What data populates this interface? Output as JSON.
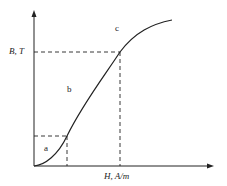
{
  "diagram": {
    "type": "B-H magnetization curve",
    "axes": {
      "y_label": "B, T",
      "x_label": "H, A/m"
    },
    "regions": [
      {
        "id": "a",
        "label": "a"
      },
      {
        "id": "b",
        "label": "b"
      },
      {
        "id": "c",
        "label": "c"
      }
    ],
    "colors": {
      "line": "#222222",
      "background": "#ffffff"
    }
  }
}
